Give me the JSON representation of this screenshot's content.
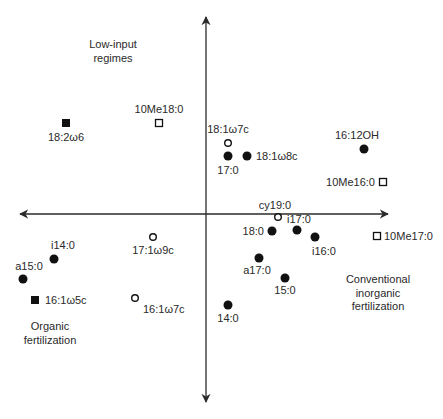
{
  "diagram": {
    "type": "ordination-biplot",
    "axes": {
      "x": {
        "from": [
          20,
          214
        ],
        "to": [
          388,
          214
        ],
        "arrows": "both"
      },
      "y": {
        "from": [
          206,
          17
        ],
        "to": [
          206,
          402
        ],
        "arrows": "both"
      }
    },
    "regions": [
      {
        "id": "low-input",
        "lines": [
          "Low-input",
          "regimes"
        ],
        "x": 113,
        "y": 48
      },
      {
        "id": "conventional",
        "lines": [
          "Conventional",
          "inorganic",
          "fertilization"
        ],
        "x": 378,
        "y": 283
      },
      {
        "id": "organic",
        "lines": [
          "Organic",
          "fertilization"
        ],
        "x": 50,
        "y": 330
      }
    ],
    "legend_shapes": {
      "filled-circle": "filled circle",
      "open-circle": "open circle",
      "filled-square": "filled square",
      "open-square": "open square"
    },
    "points": [
      {
        "label": "18:2ω6",
        "shape": "filled-square",
        "x": 66,
        "y": 123,
        "lx": 66,
        "ly": 141,
        "anchor": "middle"
      },
      {
        "label": "10Me18:0",
        "shape": "open-square",
        "x": 159,
        "y": 123,
        "lx": 159,
        "ly": 113,
        "anchor": "middle"
      },
      {
        "label": "18:1ω7c",
        "shape": "open-circle",
        "x": 228,
        "y": 143,
        "lx": 228,
        "ly": 133,
        "anchor": "middle"
      },
      {
        "label": "17:0",
        "shape": "filled-circle",
        "x": 228,
        "y": 156,
        "lx": 228,
        "ly": 174,
        "anchor": "middle"
      },
      {
        "label": "18:1ω8c",
        "shape": "filled-circle",
        "x": 247,
        "y": 156,
        "lx": 256,
        "ly": 160,
        "anchor": "start"
      },
      {
        "label": "16:12OH",
        "shape": "filled-circle",
        "x": 364,
        "y": 149,
        "lx": 357,
        "ly": 139,
        "anchor": "middle"
      },
      {
        "label": "10Me16:0",
        "shape": "open-square",
        "x": 383,
        "y": 182,
        "lx": 375,
        "ly": 186,
        "anchor": "end"
      },
      {
        "label": "cy19:0",
        "shape": "open-circle",
        "x": 278,
        "y": 217,
        "lx": 275,
        "ly": 209,
        "anchor": "middle"
      },
      {
        "label": "i17:0",
        "shape": "filled-circle",
        "x": 297,
        "y": 230,
        "lx": 299,
        "ly": 223,
        "anchor": "middle"
      },
      {
        "label": "18:0",
        "shape": "filled-circle",
        "x": 272,
        "y": 231,
        "lx": 264,
        "ly": 235,
        "anchor": "end"
      },
      {
        "label": "i16:0",
        "shape": "filled-circle",
        "x": 315,
        "y": 237,
        "lx": 324,
        "ly": 255,
        "anchor": "middle"
      },
      {
        "label": "10Me17:0",
        "shape": "open-square",
        "x": 377,
        "y": 236,
        "lx": 384,
        "ly": 240,
        "anchor": "start"
      },
      {
        "label": "a17:0",
        "shape": "filled-circle",
        "x": 259,
        "y": 258,
        "lx": 257,
        "ly": 274,
        "anchor": "middle"
      },
      {
        "label": "15:0",
        "shape": "filled-circle",
        "x": 285,
        "y": 278,
        "lx": 285,
        "ly": 294,
        "anchor": "middle"
      },
      {
        "label": "14:0",
        "shape": "filled-circle",
        "x": 228,
        "y": 305,
        "lx": 228,
        "ly": 322,
        "anchor": "middle"
      },
      {
        "label": "17:1ω9c",
        "shape": "open-circle",
        "x": 153,
        "y": 237,
        "lx": 153,
        "ly": 254,
        "anchor": "middle"
      },
      {
        "label": "i14:0",
        "shape": "filled-circle",
        "x": 54,
        "y": 259,
        "lx": 63,
        "ly": 249,
        "anchor": "middle"
      },
      {
        "label": "a15:0",
        "shape": "filled-circle",
        "x": 23,
        "y": 279,
        "lx": 29,
        "ly": 270,
        "anchor": "middle"
      },
      {
        "label": "16:1ω5c",
        "shape": "filled-square",
        "x": 35,
        "y": 300,
        "lx": 45,
        "ly": 304,
        "anchor": "start"
      },
      {
        "label": "16:1ω7c",
        "shape": "open-circle",
        "x": 135,
        "y": 298,
        "lx": 143,
        "ly": 313,
        "anchor": "start"
      }
    ]
  }
}
